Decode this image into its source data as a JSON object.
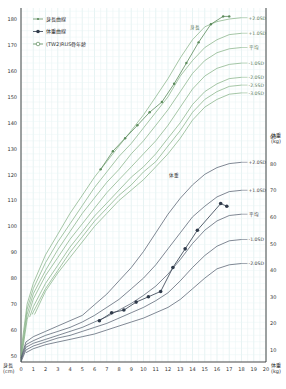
{
  "chart_data": {
    "type": "line",
    "title": "",
    "xlabel": "",
    "ylabel_left": "身長 (cm)",
    "ylabel_right": "体重 (kg)",
    "x_ticks": [
      0,
      1,
      2,
      3,
      4,
      5,
      6,
      7,
      8,
      9,
      10,
      11,
      12,
      13,
      14,
      15,
      16,
      17,
      18,
      19,
      20
    ],
    "y_left_ticks": [
      50,
      60,
      70,
      80,
      90,
      100,
      110,
      120,
      130,
      140,
      150,
      160,
      170,
      180
    ],
    "y_right_ticks": [
      10,
      20,
      30,
      40,
      50,
      60,
      70,
      80,
      90
    ],
    "xlim": [
      0,
      20
    ],
    "ylim_left": [
      47,
      186
    ],
    "ylim_right": [
      6,
      93
    ],
    "grid": true,
    "legend": {
      "position": "top-left",
      "entries": [
        {
          "label": "身長曲線",
          "marker": "small-dot",
          "color": "#5a8a5a"
        },
        {
          "label": "体重曲線",
          "marker": "filled-circle",
          "color": "#2f3a4a"
        },
        {
          "label": "(TW2)RUS骨年齢",
          "marker": "open-circle",
          "color": "#5a8a5a"
        }
      ]
    },
    "height_reference_curves": {
      "label_group": "身長",
      "color": "#7fae7f",
      "curves": [
        {
          "label": "+2.0SD",
          "points": [
            [
              0,
              52
            ],
            [
              0.5,
              70
            ],
            [
              1,
              78
            ],
            [
              2,
              89
            ],
            [
              3,
              97
            ],
            [
              4,
              105
            ],
            [
              5,
              112
            ],
            [
              6,
              119
            ],
            [
              7,
              125
            ],
            [
              8,
              131
            ],
            [
              9,
              137
            ],
            [
              10,
              143
            ],
            [
              11,
              150
            ],
            [
              12,
              157
            ],
            [
              13,
              165
            ],
            [
              14,
              172
            ],
            [
              15,
              177
            ],
            [
              16,
              179
            ],
            [
              17,
              180
            ],
            [
              18,
              180.5
            ]
          ]
        },
        {
          "label": "+1.0SD",
          "points": [
            [
              0,
              50
            ],
            [
              0.5,
              68
            ],
            [
              1,
              76
            ],
            [
              2,
              86
            ],
            [
              3,
              94
            ],
            [
              4,
              101
            ],
            [
              5,
              108
            ],
            [
              6,
              115
            ],
            [
              7,
              121
            ],
            [
              8,
              127
            ],
            [
              9,
              132
            ],
            [
              10,
              138
            ],
            [
              11,
              144
            ],
            [
              12,
              150
            ],
            [
              13,
              158
            ],
            [
              14,
              164
            ],
            [
              15,
              169
            ],
            [
              16,
              172
            ],
            [
              17,
              174
            ],
            [
              18,
              174.5
            ]
          ]
        },
        {
          "label": "平均",
          "points": [
            [
              0,
              49
            ],
            [
              0.5,
              66
            ],
            [
              1,
              74
            ],
            [
              2,
              83
            ],
            [
              3,
              91
            ],
            [
              4,
              98
            ],
            [
              5,
              105
            ],
            [
              6,
              111
            ],
            [
              7,
              117
            ],
            [
              8,
              122
            ],
            [
              9,
              128
            ],
            [
              10,
              133
            ],
            [
              11,
              139
            ],
            [
              12,
              145
            ],
            [
              13,
              152
            ],
            [
              14,
              159
            ],
            [
              15,
              164
            ],
            [
              16,
              167
            ],
            [
              17,
              168.5
            ],
            [
              18,
              169
            ]
          ]
        },
        {
          "label": "-1.0SD",
          "points": [
            [
              0,
              48
            ],
            [
              0.5,
              64
            ],
            [
              1,
              72
            ],
            [
              2,
              81
            ],
            [
              3,
              88
            ],
            [
              4,
              95
            ],
            [
              5,
              101
            ],
            [
              6,
              107
            ],
            [
              7,
              113
            ],
            [
              8,
              118
            ],
            [
              9,
              123
            ],
            [
              10,
              128
            ],
            [
              11,
              133
            ],
            [
              12,
              139
            ],
            [
              13,
              146
            ],
            [
              14,
              153
            ],
            [
              15,
              158
            ],
            [
              16,
              161
            ],
            [
              17,
              162.5
            ],
            [
              18,
              163
            ]
          ]
        },
        {
          "label": "-2.0SD",
          "points": [
            [
              0.7,
              65
            ],
            [
              1,
              69
            ],
            [
              2,
              78
            ],
            [
              3,
              85
            ],
            [
              4,
              92
            ],
            [
              5,
              98
            ],
            [
              6,
              104
            ],
            [
              7,
              109
            ],
            [
              8,
              114
            ],
            [
              9,
              119
            ],
            [
              10,
              123
            ],
            [
              11,
              128
            ],
            [
              12,
              134
            ],
            [
              13,
              140
            ],
            [
              14,
              147
            ],
            [
              15,
              152
            ],
            [
              16,
              155
            ],
            [
              17,
              157
            ],
            [
              18,
              157.5
            ]
          ]
        },
        {
          "label": "-2.5SD",
          "points": [
            [
              0.9,
              66
            ],
            [
              1,
              67
            ],
            [
              2,
              76
            ],
            [
              3,
              83
            ],
            [
              4,
              90
            ],
            [
              5,
              96
            ],
            [
              6,
              102
            ],
            [
              7,
              107
            ],
            [
              8,
              112
            ],
            [
              9,
              116
            ],
            [
              10,
              121
            ],
            [
              11,
              125
            ],
            [
              12,
              131
            ],
            [
              13,
              137
            ],
            [
              14,
              144
            ],
            [
              15,
              149
            ],
            [
              16,
              152
            ],
            [
              17,
              154
            ],
            [
              18,
              154.5
            ]
          ]
        },
        {
          "label": "-3.0SD",
          "points": [
            [
              1.1,
              66
            ],
            [
              2,
              75
            ],
            [
              3,
              82
            ],
            [
              4,
              88
            ],
            [
              5,
              94
            ],
            [
              6,
              100
            ],
            [
              7,
              105
            ],
            [
              8,
              110
            ],
            [
              9,
              114
            ],
            [
              10,
              118
            ],
            [
              11,
              123
            ],
            [
              12,
              128
            ],
            [
              13,
              134
            ],
            [
              14,
              141
            ],
            [
              15,
              146
            ],
            [
              16,
              149
            ],
            [
              17,
              151
            ],
            [
              18,
              151.5
            ]
          ]
        }
      ]
    },
    "weight_reference_curves": {
      "label_group": "体重",
      "color": "#4a5566",
      "curves": [
        {
          "label": "+2.0SD",
          "points": [
            [
              0,
              7
            ],
            [
              0.4,
              13
            ],
            [
              1,
              15
            ],
            [
              2,
              17
            ],
            [
              3,
              19
            ],
            [
              4,
              21
            ],
            [
              5,
              23
            ],
            [
              6,
              27
            ],
            [
              7,
              31
            ],
            [
              8,
              36
            ],
            [
              9,
              41
            ],
            [
              10,
              47
            ],
            [
              11,
              54
            ],
            [
              12,
              61
            ],
            [
              13,
              67
            ],
            [
              14,
              72
            ],
            [
              15,
              76
            ],
            [
              16,
              78.5
            ],
            [
              17,
              80
            ],
            [
              18,
              80.5
            ]
          ]
        },
        {
          "label": "+1.0SD",
          "points": [
            [
              0,
              6.5
            ],
            [
              0.4,
              12
            ],
            [
              1,
              13.5
            ],
            [
              2,
              15.5
            ],
            [
              3,
              17
            ],
            [
              4,
              18.5
            ],
            [
              5,
              20.5
            ],
            [
              6,
              23
            ],
            [
              7,
              26
            ],
            [
              8,
              29
            ],
            [
              9,
              33
            ],
            [
              10,
              37
            ],
            [
              11,
              42
            ],
            [
              12,
              48
            ],
            [
              13,
              54
            ],
            [
              14,
              60
            ],
            [
              15,
              64
            ],
            [
              16,
              67.5
            ],
            [
              17,
              69.5
            ],
            [
              18,
              70
            ]
          ]
        },
        {
          "label": "平均",
          "points": [
            [
              0,
              6
            ],
            [
              0.4,
              11
            ],
            [
              1,
              12.5
            ],
            [
              2,
              14
            ],
            [
              3,
              15.5
            ],
            [
              4,
              17
            ],
            [
              5,
              18.5
            ],
            [
              6,
              20.5
            ],
            [
              7,
              22.5
            ],
            [
              8,
              25
            ],
            [
              9,
              27.5
            ],
            [
              10,
              30.5
            ],
            [
              11,
              34
            ],
            [
              12,
              38.5
            ],
            [
              13,
              44
            ],
            [
              14,
              50
            ],
            [
              15,
              55
            ],
            [
              16,
              58.5
            ],
            [
              17,
              60.5
            ],
            [
              18,
              61
            ]
          ]
        },
        {
          "label": "-1.0SD",
          "points": [
            [
              0,
              5.5
            ],
            [
              0.4,
              10
            ],
            [
              1,
              11.5
            ],
            [
              2,
              13
            ],
            [
              3,
              14.5
            ],
            [
              4,
              15.5
            ],
            [
              5,
              17
            ],
            [
              6,
              18.5
            ],
            [
              7,
              20
            ],
            [
              8,
              22
            ],
            [
              9,
              24
            ],
            [
              10,
              26
            ],
            [
              11,
              28.5
            ],
            [
              12,
              31.5
            ],
            [
              13,
              36
            ],
            [
              14,
              41
            ],
            [
              15,
              45.5
            ],
            [
              16,
              49
            ],
            [
              17,
              51
            ],
            [
              18,
              51.5
            ]
          ]
        },
        {
          "label": "-2.0SD",
          "points": [
            [
              0.4,
              9
            ],
            [
              1,
              10.5
            ],
            [
              2,
              12
            ],
            [
              3,
              13
            ],
            [
              4,
              14
            ],
            [
              5,
              15
            ],
            [
              6,
              16
            ],
            [
              7,
              17.5
            ],
            [
              8,
              19
            ],
            [
              9,
              20.5
            ],
            [
              10,
              22
            ],
            [
              11,
              24
            ],
            [
              12,
              26
            ],
            [
              13,
              29
            ],
            [
              14,
              33
            ],
            [
              15,
              37
            ],
            [
              16,
              40.5
            ],
            [
              17,
              42
            ],
            [
              18,
              42.5
            ]
          ]
        }
      ]
    },
    "series": [
      {
        "name": "身長曲線",
        "axis": "left",
        "color": "#5a8a5a",
        "marker": "small-dot",
        "x": [
          6.5,
          7.5,
          8.5,
          9.5,
          10.5,
          11.5,
          12.5,
          13.5,
          14.5,
          15.5,
          16.5,
          17.0
        ],
        "values": [
          122,
          129,
          134,
          139,
          144,
          148,
          155,
          163,
          171,
          178,
          181,
          181
        ]
      },
      {
        "name": "体重曲線",
        "axis": "right",
        "color": "#2f3a4a",
        "marker": "filled-circle",
        "x": [
          6.4,
          7.4,
          8.4,
          9.4,
          10.4,
          11.4,
          12.4,
          13.4,
          14.4,
          16.3,
          16.8
        ],
        "values": [
          21,
          24,
          25,
          28,
          30,
          32,
          41,
          48,
          55,
          65,
          64
        ]
      }
    ],
    "annotations": [
      {
        "text": "身長",
        "near": "height +2.0SD curve, age ~14"
      },
      {
        "text": "体重",
        "near": "weight +2.0SD curve, age ~12"
      }
    ]
  },
  "axis_labels": {
    "left_unit_top": "身長",
    "left_unit_bottom": "(cm)",
    "right_unit_top": "体重",
    "right_unit_bottom": "(kg)"
  }
}
